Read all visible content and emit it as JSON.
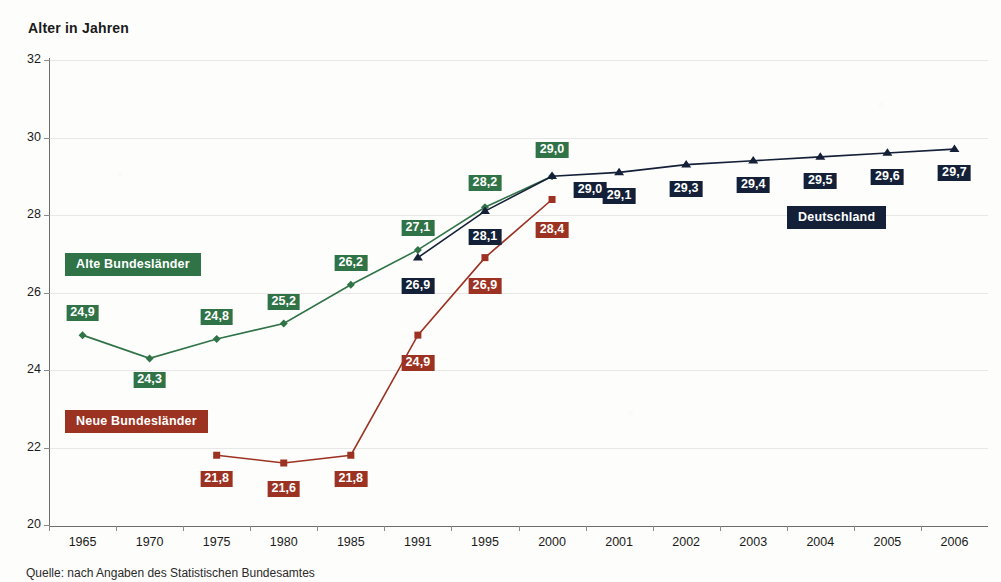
{
  "axis_title": "Alter in Jahren",
  "source_note": "Quelle: nach Angaben des Statistischen Bundesamtes",
  "colors": {
    "green": "#2f7347",
    "red": "#9c3222",
    "navy": "#141f38",
    "grid": "#e7e7e7",
    "axis": "#6d6d6d",
    "background": "#fdfdfb"
  },
  "series_tags": [
    {
      "label": "Alte Bundesländer",
      "color_key": "green",
      "x": 65,
      "y": 253
    },
    {
      "label": "Neue Bundesländer",
      "color_key": "red",
      "x": 65,
      "y": 410
    },
    {
      "label": "Deutschland",
      "color_key": "navy",
      "x": 787,
      "y": 206
    }
  ],
  "chart_data": {
    "type": "line",
    "title": "",
    "xlabel": "",
    "ylabel": "Alter in Jahren",
    "ylim": [
      20,
      32
    ],
    "yticks": [
      20,
      22,
      24,
      26,
      28,
      30,
      32
    ],
    "ytick_labels": [
      "20",
      "22",
      "24",
      "26",
      "28",
      "30",
      "32"
    ],
    "grid": true,
    "legend_position": "inline-labels",
    "categories": [
      "1965",
      "1970",
      "1975",
      "1980",
      "1985",
      "1991",
      "1995",
      "2000",
      "2001",
      "2002",
      "2003",
      "2004",
      "2005",
      "2006"
    ],
    "series": [
      {
        "name": "Alte Bundesländer",
        "color_key": "green",
        "marker": "diamond",
        "values": [
          24.9,
          24.3,
          24.8,
          25.2,
          26.2,
          27.1,
          28.2,
          29.0,
          null,
          null,
          null,
          null,
          null,
          null
        ],
        "value_labels": [
          "24,9",
          "24,3",
          "24,8",
          "25,2",
          "26,2",
          "27,1",
          "28,2",
          "29,0",
          null,
          null,
          null,
          null,
          null,
          null
        ]
      },
      {
        "name": "Neue Bundesländer",
        "color_key": "red",
        "marker": "square",
        "values": [
          null,
          null,
          21.8,
          21.6,
          21.8,
          24.9,
          26.9,
          28.4,
          null,
          null,
          null,
          null,
          null,
          null
        ],
        "value_labels": [
          null,
          null,
          "21,8",
          "21,6",
          "21,8",
          "24,9",
          "26,9",
          "28,4",
          null,
          null,
          null,
          null,
          null,
          null
        ]
      },
      {
        "name": "Deutschland",
        "color_key": "navy",
        "marker": "triangle",
        "values": [
          null,
          null,
          null,
          null,
          null,
          26.9,
          28.1,
          29.0,
          29.1,
          29.3,
          29.4,
          29.5,
          29.6,
          29.7
        ],
        "value_labels": [
          null,
          null,
          null,
          null,
          null,
          "26,9",
          "28,1",
          "29,0",
          "29,1",
          "29,3",
          "29,4",
          "29,5",
          "29,6",
          "29,7"
        ]
      }
    ],
    "label_offsets": {
      "Alte Bundesländer": [
        [
          0,
          -22
        ],
        [
          0,
          22
        ],
        [
          0,
          -22
        ],
        [
          0,
          -22
        ],
        [
          0,
          -22
        ],
        [
          0,
          -22
        ],
        [
          0,
          -24
        ],
        [
          0,
          -26
        ]
      ],
      "Neue Bundesländer": [
        null,
        null,
        [
          0,
          24
        ],
        [
          0,
          26
        ],
        [
          0,
          24
        ],
        [
          0,
          28
        ],
        [
          0,
          28
        ],
        [
          0,
          30
        ]
      ],
      "Deutschland": [
        null,
        null,
        null,
        null,
        null,
        [
          0,
          28
        ],
        [
          0,
          26
        ],
        [
          38,
          14
        ],
        [
          0,
          24
        ],
        [
          0,
          24
        ],
        [
          0,
          24
        ],
        [
          0,
          24
        ],
        [
          0,
          24
        ],
        [
          0,
          24
        ]
      ]
    }
  }
}
